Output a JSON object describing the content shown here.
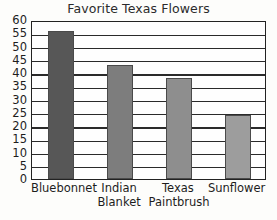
{
  "chart_data": {
    "type": "bar",
    "title": "Favorite Texas Flowers",
    "xlabel": "",
    "ylabel": "",
    "categories": [
      "Bluebonnet",
      "Indian Blanket",
      "Texas Paintbrush",
      "Sunflower"
    ],
    "category_lines": [
      [
        "Bluebonnet",
        ""
      ],
      [
        "Indian",
        "Blanket"
      ],
      [
        "Texas",
        "Paintbrush"
      ],
      [
        "Sunflower",
        ""
      ]
    ],
    "values": [
      56,
      43,
      38,
      24
    ],
    "ylim": [
      0,
      60
    ],
    "yticks": [
      0,
      5,
      10,
      15,
      20,
      25,
      30,
      35,
      40,
      45,
      50,
      55,
      60
    ],
    "ytick_labels": [
      "0",
      "5",
      "10",
      "15",
      "20",
      "25",
      "30",
      "35",
      "40",
      "45",
      "50",
      "55",
      "60"
    ],
    "grid": true,
    "grid_axis": "y",
    "legend": false,
    "bar_colors": [
      "#575757",
      "#7d7d7d",
      "#8e8e8e",
      "#9d9d9d"
    ],
    "frame_color": "#222222",
    "background_color": "#fdfdfb"
  }
}
